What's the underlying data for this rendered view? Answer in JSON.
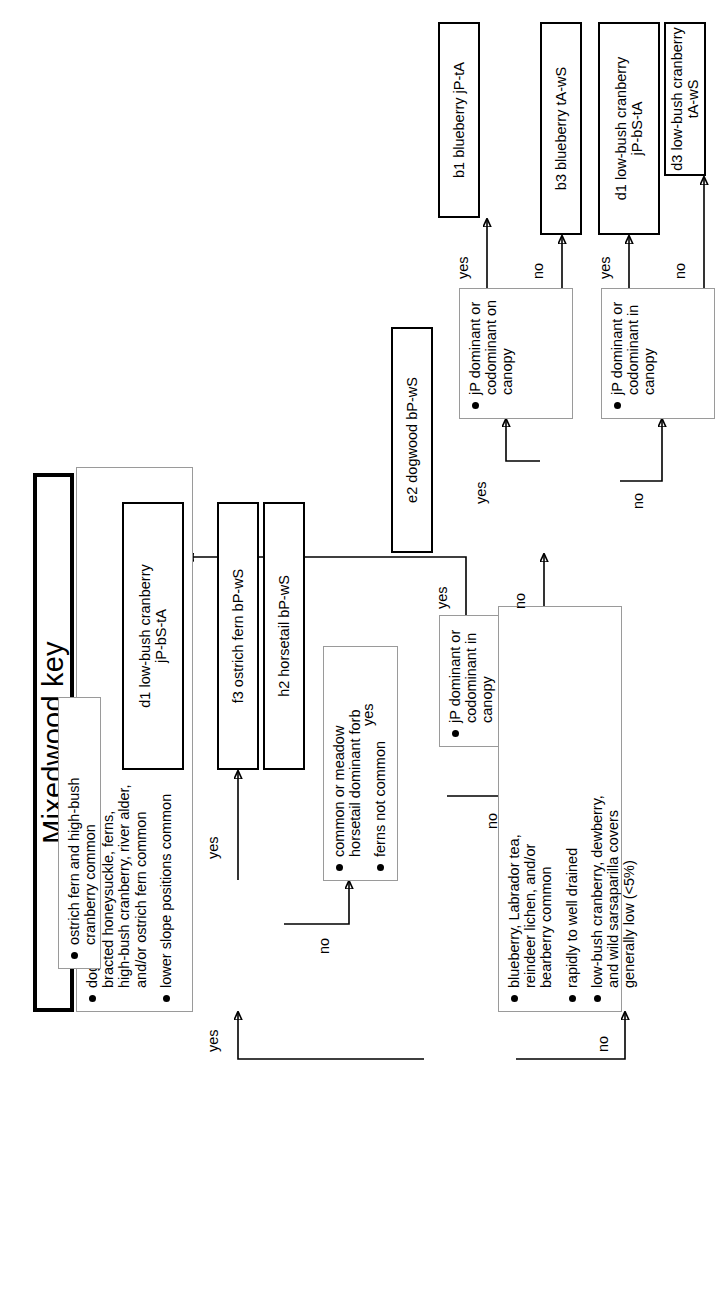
{
  "diagram": {
    "type": "dichotomous-key-flowchart",
    "title": "Mixedwood key",
    "orientation": "rotated-90-ccw",
    "branch_labels": {
      "yes": "yes",
      "no": "no"
    },
    "questions": [
      {
        "id": "q1",
        "bullets": [
          "dogwood, horsetails, currants,\nbracted honeysuckle, ferns,\nhigh-bush cranberry, river alder,\nand/or ostrich fern common",
          "lower slope positions common"
        ]
      },
      {
        "id": "q2",
        "bullets": [
          "ostrich fern and high-bush\ncranberry common"
        ]
      },
      {
        "id": "q3",
        "bullets": [
          "common or meadow\nhorsetail dominant forb",
          "ferns not common"
        ]
      },
      {
        "id": "q4",
        "bullets": [
          "jP dominant or\ncodominant in\ncanopy"
        ]
      },
      {
        "id": "q5",
        "bullets": [
          "blueberry, Labrador tea,\nreindeer lichen, and/or\nbearberry common",
          "rapidly to well drained",
          "low-bush cranberry, dewberry,\nand wild sarsaparilla covers\ngenerally low (<5%)"
        ]
      },
      {
        "id": "q6",
        "bullets": [
          "jP dominant or\ncodominant on\ncanopy"
        ]
      },
      {
        "id": "q7",
        "bullets": [
          "jP dominant or\ncodominant in\ncanopy"
        ]
      }
    ],
    "outcomes": [
      {
        "id": "f3",
        "label": "f3  ostrich fern bP-wS"
      },
      {
        "id": "h2",
        "label": "h2  horsetail bP-wS"
      },
      {
        "id": "d1a",
        "label": "d1  low-bush cranberry\njP-bS-tA"
      },
      {
        "id": "e2",
        "label": "e2  dogwood bP-wS"
      },
      {
        "id": "b1",
        "label": "b1  blueberry jP-tA"
      },
      {
        "id": "b3",
        "label": "b3  blueberry tA-wS"
      },
      {
        "id": "d1b",
        "label": "d1  low-bush cranberry\njP-bS-tA"
      },
      {
        "id": "d3",
        "label": "d3  low-bush cranberry tA-wS"
      }
    ],
    "edges": [
      {
        "from": "q1",
        "to": "q2",
        "label": "yes"
      },
      {
        "from": "q1",
        "to": "q5",
        "label": "no"
      },
      {
        "from": "q2",
        "to": "f3",
        "label": "yes"
      },
      {
        "from": "q2",
        "to": "q3",
        "label": "no"
      },
      {
        "from": "q3",
        "to": "h2",
        "label": "yes"
      },
      {
        "from": "q3",
        "to": "q4",
        "label": "no"
      },
      {
        "from": "q4",
        "to": "d1a",
        "label": "yes"
      },
      {
        "from": "q4",
        "to": "e2",
        "label": "no"
      },
      {
        "from": "q5",
        "to": "q6",
        "label": "yes"
      },
      {
        "from": "q5",
        "to": "q7",
        "label": "no"
      },
      {
        "from": "q6",
        "to": "b1",
        "label": "yes"
      },
      {
        "from": "q6",
        "to": "b3",
        "label": "no"
      },
      {
        "from": "q7",
        "to": "d1b",
        "label": "yes"
      },
      {
        "from": "q7",
        "to": "d3",
        "label": "no"
      }
    ]
  }
}
